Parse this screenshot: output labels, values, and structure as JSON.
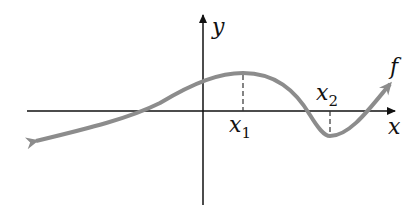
{
  "diagram": {
    "axis_x_label": "x",
    "axis_y_label": "y",
    "function_label": "f",
    "point1": {
      "base": "x",
      "sub": "1"
    },
    "point2": {
      "base": "x",
      "sub": "2"
    },
    "colors": {
      "axis": "#111111",
      "curve": "#8c8c8c",
      "dash": "#333333"
    }
  }
}
